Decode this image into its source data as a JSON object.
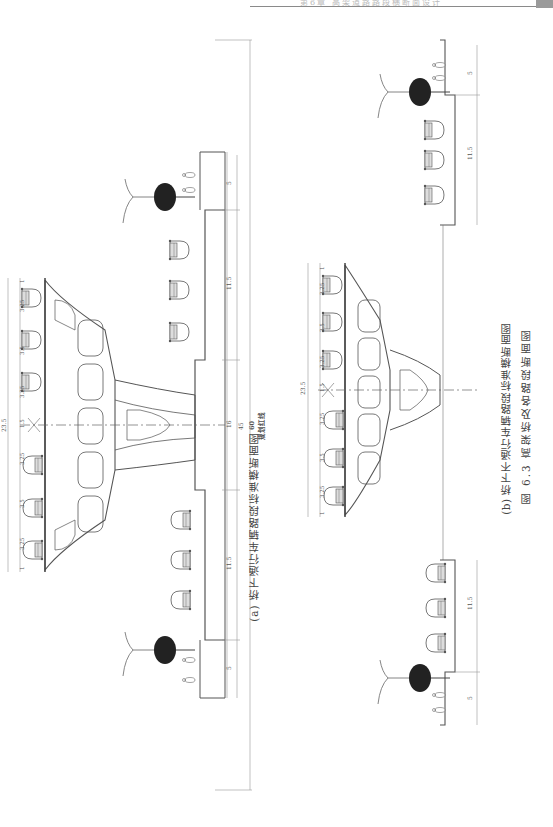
{
  "page": {
    "header_text": "第6章 高架道路路段横断面设计",
    "figure_caption": "图 6.3   高架桥及各路段断面图"
  },
  "drawing_a": {
    "caption": "(a) 桥下通行车辆路段标准横断面图",
    "red_line_label": "规划红线",
    "total_width": "60",
    "road_width": "45",
    "median_width": "16",
    "side_road_width": "11.5",
    "sidewalk_width": "5",
    "deck_total": "23.5",
    "deck_dims": [
      "1",
      "3.25",
      "3.5",
      "3.25",
      "1.5",
      "3.25",
      "3.5",
      "3.25",
      "1"
    ]
  },
  "drawing_b": {
    "caption": "(b) 桥下不通行车辆路段标准横断面图",
    "deck_total": "23.5",
    "deck_dims": [
      "1",
      "3.25",
      "3.5",
      "3.25",
      "1.5",
      "3.25",
      "3.5",
      "3.25",
      "1"
    ],
    "side_road_width": "11.5",
    "sidewalk_width": "5"
  },
  "colors": {
    "line": "#4a4a4a",
    "dim_line": "#888888",
    "tree": "#222222"
  }
}
